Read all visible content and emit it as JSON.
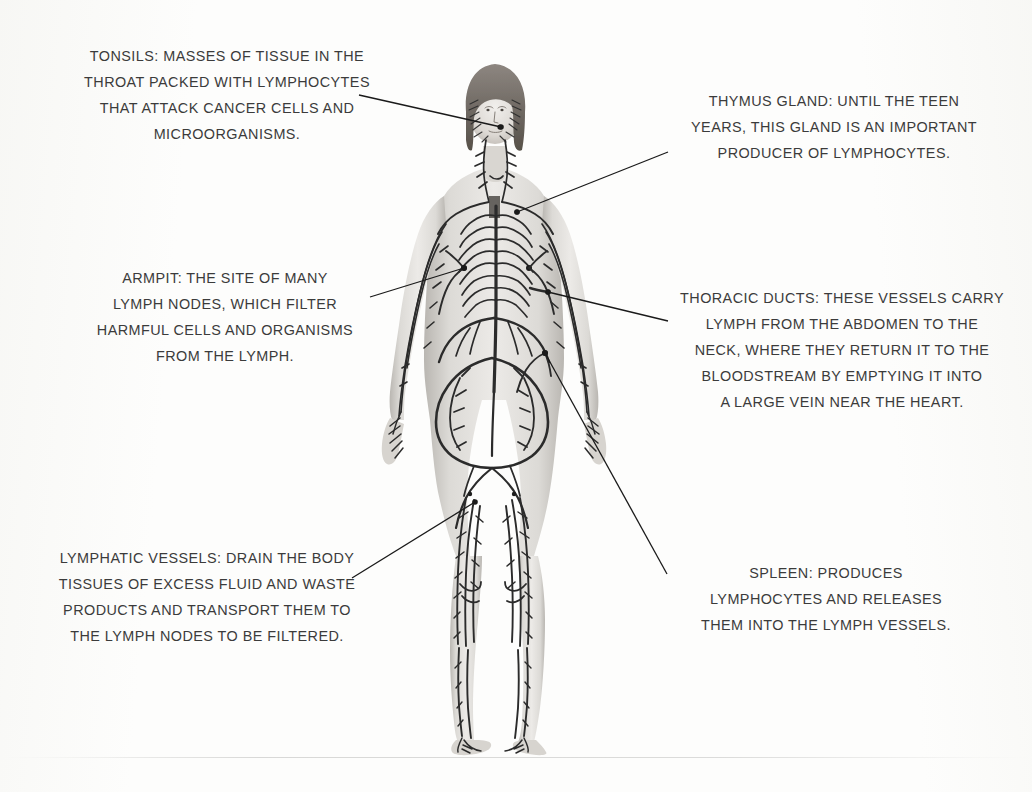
{
  "page": {
    "background_color": "#fdfdfc",
    "text_color": "#3b3b3b",
    "line_color": "#1a1a1a",
    "width": 1032,
    "height": 792
  },
  "figure": {
    "name": "human-lymphatic-system-figure",
    "skin_color": "#d8d6d2",
    "vessel_color": "#2b2b2b",
    "hair_color": "#6b655f"
  },
  "callouts": [
    {
      "id": "tonsils",
      "label": "TONSILS",
      "text": "TONSILS: MASSES OF TISSUE IN THE\nTHROAT PACKED WITH LYMPHOCYTES\nTHAT ATTACK CANCER CELLS AND\nMICROORGANISMS.",
      "position": "top-left"
    },
    {
      "id": "thymus-gland",
      "label": "THYMUS GLAND",
      "text": "THYMUS GLAND: UNTIL THE TEEN\nYEARS, THIS GLAND IS AN IMPORTANT\nPRODUCER OF LYMPHOCYTES.",
      "position": "top-right"
    },
    {
      "id": "armpit",
      "label": "ARMPIT",
      "text": "ARMPIT: THE SITE OF MANY\nLYMPH NODES, WHICH FILTER\nHARMFUL CELLS AND ORGANISMS\nFROM THE LYMPH.",
      "position": "middle-left"
    },
    {
      "id": "thoracic-ducts",
      "label": "THORACIC DUCTS",
      "text": "THORACIC DUCTS: THESE VESSELS CARRY\nLYMPH FROM THE ABDOMEN TO THE\nNECK, WHERE THEY RETURN IT TO THE\nBLOODSTREAM BY EMPTYING IT INTO\nA LARGE VEIN NEAR THE HEART.",
      "position": "middle-right"
    },
    {
      "id": "lymphatic-vessels",
      "label": "LYMPHATIC VESSELS",
      "text": "LYMPHATIC VESSELS: DRAIN THE BODY\nTISSUES OF EXCESS FLUID AND WASTE\nPRODUCTS AND TRANSPORT THEM TO\nTHE LYMPH NODES TO BE FILTERED.",
      "position": "bottom-left"
    },
    {
      "id": "spleen",
      "label": "SPLEEN",
      "text": "SPLEEN: PRODUCES\nLYMPHOCYTES AND RELEASES\nTHEM INTO THE LYMPH VESSELS.",
      "position": "bottom-right"
    }
  ],
  "leader_lines": [
    {
      "id": "tonsils-leader",
      "x1": 359,
      "y1": 95,
      "x2": 501,
      "y2": 127,
      "dot": true
    },
    {
      "id": "thymus-gland-leader",
      "x1": 668,
      "y1": 152,
      "x2": 517,
      "y2": 212,
      "dot": true
    },
    {
      "id": "armpit-leader",
      "x1": 370,
      "y1": 297,
      "x2": 464,
      "y2": 268,
      "dot": true
    },
    {
      "id": "thoracic-ducts-leader",
      "x1": 668,
      "y1": 321,
      "x2": 548,
      "y2": 292,
      "dot": true
    },
    {
      "id": "lymphatic-vessels-leader",
      "x1": 352,
      "y1": 578,
      "x2": 475,
      "y2": 502,
      "dot": true
    },
    {
      "id": "spleen-leader",
      "x1": 667,
      "y1": 574,
      "x2": 545,
      "y2": 353,
      "dot": true
    }
  ]
}
